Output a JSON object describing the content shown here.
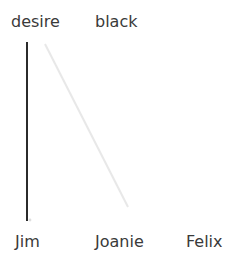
{
  "canvas": {
    "width": 239,
    "height": 269,
    "background": "#ffffff"
  },
  "top_labels": [
    {
      "text": "desire",
      "x": 11,
      "color": "#3a3a3a"
    },
    {
      "text": "black",
      "x": 95,
      "color": "#3a3a3a"
    }
  ],
  "bottom_labels": [
    {
      "text": "Jim",
      "x": 15,
      "color": "#3a3a3a"
    },
    {
      "text": "Joanie",
      "x": 95,
      "color": "#3a3a3a"
    },
    {
      "text": "Felix",
      "x": 186,
      "color": "#3a3a3a"
    }
  ],
  "chart_data": {
    "type": "line",
    "title": "",
    "xlabel": "",
    "ylabel": "",
    "grid": false,
    "legend_position": "top",
    "categories": [
      "Jim",
      "Joanie",
      "Felix"
    ],
    "legend_entries": [
      "desire",
      "black"
    ],
    "series": [
      {
        "name": "desire",
        "color": "#2b2b2b",
        "stroke_width": 2,
        "points": [
          [
            27,
            42
          ],
          [
            27,
            221
          ]
        ]
      },
      {
        "name": "black",
        "color": "#e8e8e8",
        "stroke_width": 2,
        "points": [
          [
            45,
            44
          ],
          [
            128,
            207
          ]
        ]
      }
    ],
    "marker": {
      "name": "endpoint-dot",
      "color": "#dedede",
      "x": 30,
      "y": 220,
      "radius": 1.4
    }
  }
}
